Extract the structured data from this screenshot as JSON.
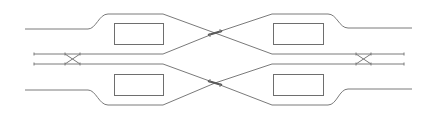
{
  "diagram": {
    "type": "track-layout",
    "colors": {
      "line": "#7a7a7a",
      "platform": "#6e6e6e",
      "background": "#ffffff"
    },
    "platforms": [
      {
        "id": "top-left",
        "x": 114,
        "y": 23,
        "w": 49,
        "h": 21
      },
      {
        "id": "bottom-left",
        "x": 114,
        "y": 74,
        "w": 49,
        "h": 21
      },
      {
        "id": "top-right",
        "x": 273,
        "y": 23,
        "w": 50,
        "h": 21
      },
      {
        "id": "bottom-right",
        "x": 273,
        "y": 74,
        "w": 50,
        "h": 21
      }
    ],
    "crossovers": [
      {
        "id": "left",
        "x1": 65,
        "x2": 80,
        "y1": 54,
        "y2": 64
      },
      {
        "id": "right",
        "x1": 355,
        "x2": 371,
        "y1": 54,
        "y2": 64
      }
    ],
    "central_crossings": [
      {
        "id": "upper",
        "x": 215,
        "y": 33
      },
      {
        "id": "lower",
        "x": 215,
        "y": 83
      }
    ]
  }
}
